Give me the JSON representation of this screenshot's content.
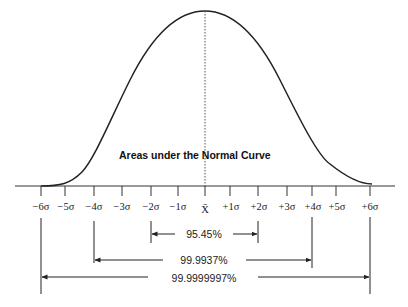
{
  "diagram": {
    "title": "Areas under the Normal Curve",
    "colors": {
      "line": "#222222",
      "background": "#ffffff",
      "text": "#222222"
    },
    "axis": {
      "ticks": [
        {
          "label": "−6σ",
          "x": 41
        },
        {
          "label": "−5σ",
          "x": 65
        },
        {
          "label": "−4σ",
          "x": 94
        },
        {
          "label": "−3σ",
          "x": 122
        },
        {
          "label": "−2σ",
          "x": 151
        },
        {
          "label": "−1σ",
          "x": 178
        },
        {
          "label": "X̄",
          "x": 205
        },
        {
          "label": "+1σ",
          "x": 230
        },
        {
          "label": "+2σ",
          "x": 258
        },
        {
          "label": "+3σ",
          "x": 287
        },
        {
          "label": "+4σ",
          "x": 312
        },
        {
          "label": "+5σ",
          "x": 336
        },
        {
          "label": "+6σ",
          "x": 370
        }
      ]
    },
    "ranges": [
      {
        "label": "95.45%",
        "from": "−2σ",
        "to": "+2σ"
      },
      {
        "label": "99.9937%",
        "from": "−4σ",
        "to": "+4σ"
      },
      {
        "label": "99.9999997%",
        "from": "−6σ",
        "to": "+6σ"
      }
    ]
  }
}
